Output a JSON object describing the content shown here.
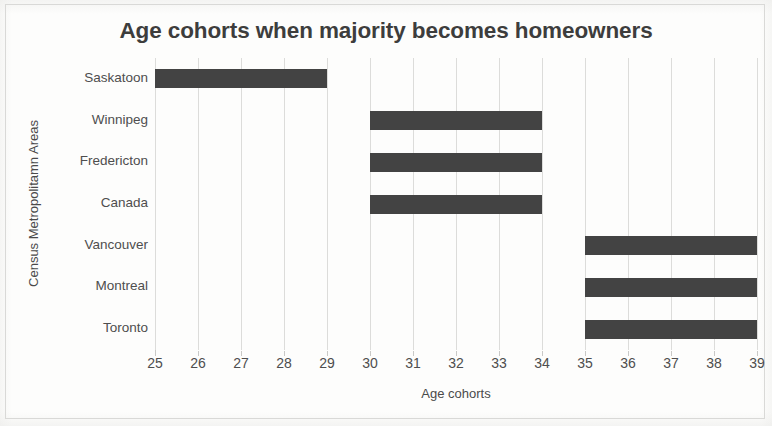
{
  "chart_data": {
    "type": "bar",
    "orientation": "horizontal",
    "subtype": "range-bar",
    "title": "Age cohorts when majority becomes homeowners",
    "xlabel": "Age cohorts",
    "ylabel": "Census Metropolitamn Areas",
    "xlim": [
      25,
      39
    ],
    "xticks": [
      25,
      26,
      27,
      28,
      29,
      30,
      31,
      32,
      33,
      34,
      35,
      36,
      37,
      38,
      39
    ],
    "xtick_labels": [
      "25",
      "26",
      "27",
      "28",
      "29",
      "30",
      "31",
      "32",
      "33",
      "34",
      "35",
      "36",
      "37",
      "38",
      "39"
    ],
    "grid": "vertical",
    "legend": "none",
    "bar_color": "#434343",
    "gridline_color": "#dcdcda",
    "categories": [
      "Saskatoon",
      "Winnipeg",
      "Fredericton",
      "Canada",
      "Vancouver",
      "Montreal",
      "Toronto"
    ],
    "series": [
      {
        "name": "Age cohort range",
        "ranges": [
          {
            "category": "Saskatoon",
            "start": 25,
            "end": 29
          },
          {
            "category": "Winnipeg",
            "start": 30,
            "end": 34
          },
          {
            "category": "Fredericton",
            "start": 30,
            "end": 34
          },
          {
            "category": "Canada",
            "start": 30,
            "end": 34
          },
          {
            "category": "Vancouver",
            "start": 35,
            "end": 39
          },
          {
            "category": "Montreal",
            "start": 35,
            "end": 39
          },
          {
            "category": "Toronto",
            "start": 35,
            "end": 39
          }
        ]
      }
    ]
  }
}
